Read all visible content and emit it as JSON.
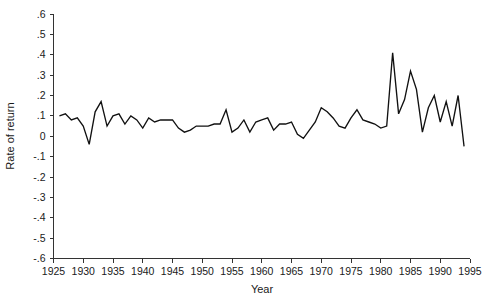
{
  "chart_data": {
    "type": "line",
    "title": "",
    "xlabel": "Year",
    "ylabel": "Rate of return",
    "xlim": [
      1925,
      1995
    ],
    "ylim": [
      -0.6,
      0.6
    ],
    "grid": false,
    "legend": false,
    "xticks": [
      1925,
      1930,
      1935,
      1940,
      1945,
      1950,
      1955,
      1960,
      1965,
      1970,
      1975,
      1980,
      1985,
      1990,
      1995
    ],
    "xtick_labels": [
      "1925",
      "1930",
      "1935",
      "1940",
      "1945",
      "1950",
      "1955",
      "1960",
      "1965",
      "1970",
      "1975",
      "1980",
      "1985",
      "1990",
      "1995"
    ],
    "yticks": [
      0.6,
      0.5,
      0.4,
      0.3,
      0.2,
      0.1,
      0.0,
      -0.1,
      -0.2,
      -0.3,
      -0.4,
      -0.5,
      -0.6
    ],
    "ytick_labels": [
      ".6",
      ".5",
      ".4",
      ".3",
      ".2",
      ".1",
      "0",
      "-.1",
      "-.2",
      "-.3",
      "-.4",
      "-.5",
      "-.6"
    ],
    "series": [
      {
        "name": "Rate of return",
        "color": "#111111",
        "x": [
          1926,
          1927,
          1928,
          1929,
          1930,
          1931,
          1932,
          1933,
          1934,
          1935,
          1936,
          1937,
          1938,
          1939,
          1940,
          1941,
          1942,
          1943,
          1944,
          1945,
          1946,
          1947,
          1948,
          1949,
          1950,
          1951,
          1952,
          1953,
          1954,
          1955,
          1956,
          1957,
          1958,
          1959,
          1960,
          1961,
          1962,
          1963,
          1964,
          1965,
          1966,
          1967,
          1968,
          1969,
          1970,
          1971,
          1972,
          1973,
          1974,
          1975,
          1976,
          1977,
          1978,
          1979,
          1980,
          1981,
          1982,
          1983,
          1984,
          1985,
          1986,
          1987,
          1988,
          1989,
          1990,
          1991,
          1992,
          1993,
          1994
        ],
        "y": [
          0.1,
          0.11,
          0.08,
          0.09,
          0.05,
          -0.04,
          0.12,
          0.17,
          0.05,
          0.1,
          0.11,
          0.06,
          0.1,
          0.08,
          0.04,
          0.09,
          0.07,
          0.08,
          0.08,
          0.08,
          0.04,
          0.02,
          0.03,
          0.05,
          0.05,
          0.05,
          0.06,
          0.06,
          0.13,
          0.02,
          0.04,
          0.08,
          0.02,
          0.07,
          0.08,
          0.09,
          0.03,
          0.06,
          0.06,
          0.07,
          0.01,
          -0.01,
          0.03,
          0.07,
          0.14,
          0.12,
          0.09,
          0.05,
          0.04,
          0.09,
          0.13,
          0.08,
          0.07,
          0.06,
          0.04,
          0.05,
          0.41,
          0.11,
          0.18,
          0.32,
          0.23,
          0.02,
          0.14,
          0.2,
          0.07,
          0.17,
          0.05,
          0.2,
          -0.05
        ]
      }
    ]
  }
}
